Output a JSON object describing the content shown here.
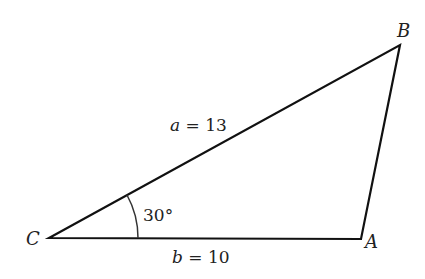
{
  "figure": {
    "type": "triangle",
    "vertices": {
      "A": {
        "label": "A",
        "x": 361,
        "y": 239
      },
      "B": {
        "label": "B",
        "x": 400,
        "y": 45
      },
      "C": {
        "label": "C",
        "x": 49,
        "y": 238
      }
    },
    "sides": {
      "a": {
        "var": "a",
        "eq": "=",
        "value": "13"
      },
      "b": {
        "var": "b",
        "eq": "=",
        "value": "10"
      }
    },
    "angle_C": {
      "text": "30°"
    },
    "stroke_color": "#111111"
  }
}
